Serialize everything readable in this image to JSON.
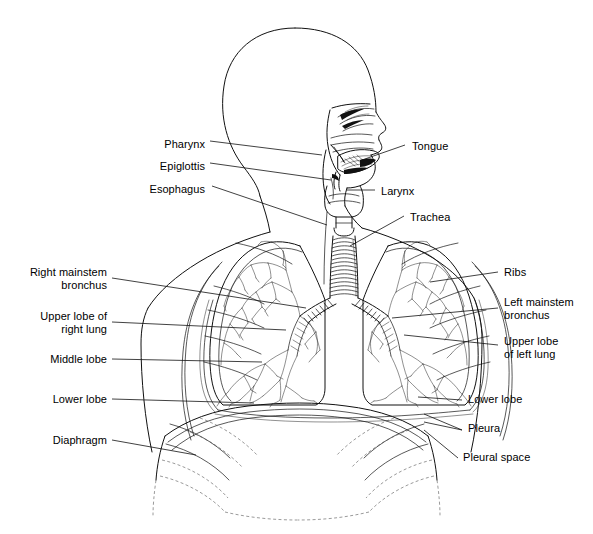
{
  "figure": {
    "type": "anatomical-line-diagram",
    "background_color": "#ffffff",
    "line_color": "#111111",
    "label_color": "#000000",
    "label_font_size_px": 11
  },
  "labels_left": [
    {
      "id": "pharynx",
      "text": "Pharynx",
      "x": 155,
      "y": 144,
      "right_edge": 205
    },
    {
      "id": "epiglottis",
      "text": "Epiglottis",
      "x": 141,
      "y": 166,
      "right_edge": 205
    },
    {
      "id": "esophagus",
      "text": "Esophagus",
      "x": 140,
      "y": 189,
      "right_edge": 205
    },
    {
      "id": "right-mainstem",
      "text": "Right mainstem\nbronchus",
      "x": 22,
      "y": 272,
      "right_edge": 107
    },
    {
      "id": "upper-lobe-right",
      "text": "Upper lobe of\nright lung",
      "x": 35,
      "y": 315,
      "right_edge": 107
    },
    {
      "id": "middle-lobe",
      "text": "Middle lobe",
      "x": 44,
      "y": 359,
      "right_edge": 107
    },
    {
      "id": "lower-lobe-right",
      "text": "Lower lobe",
      "x": 46,
      "y": 398,
      "right_edge": 107
    },
    {
      "id": "diaphragm",
      "text": "Diaphragm",
      "x": 48,
      "y": 437,
      "right_edge": 107
    }
  ],
  "labels_right": [
    {
      "id": "tongue",
      "text": "Tongue",
      "x": 412,
      "y": 146
    },
    {
      "id": "larynx",
      "text": "Larynx",
      "x": 381,
      "y": 193
    },
    {
      "id": "trachea",
      "text": "Trachea",
      "x": 410,
      "y": 218
    },
    {
      "id": "ribs",
      "text": "Ribs",
      "x": 504,
      "y": 272
    },
    {
      "id": "left-mainstem",
      "text": "Left mainstem\nbronchus",
      "x": 504,
      "y": 302
    },
    {
      "id": "upper-lobe-left",
      "text": "Upper lobe\nof left lung",
      "x": 504,
      "y": 341
    },
    {
      "id": "lower-lobe-left",
      "text": "Lower lobe",
      "x": 468,
      "y": 399
    },
    {
      "id": "pleura",
      "text": "Pleura",
      "x": 468,
      "y": 428
    },
    {
      "id": "pleural-space",
      "text": "Pleural space",
      "x": 463,
      "y": 457
    }
  ],
  "structures": [
    "skull-outline",
    "face-profile",
    "nasal-cavity",
    "oral-cavity",
    "tongue",
    "soft-palate",
    "epiglottis",
    "pharynx",
    "larynx",
    "trachea-cartilage-rings",
    "esophagus",
    "neck",
    "shoulders",
    "torso-outline",
    "right-lung",
    "left-lung",
    "pleura-double-line",
    "bronchial-tree-right",
    "bronchial-tree-left",
    "mainstem-bronchi",
    "ribs",
    "diaphragm-dome",
    "lower-ribs-dashed"
  ]
}
